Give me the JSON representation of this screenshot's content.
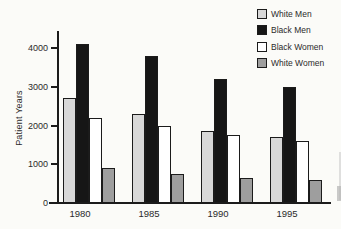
{
  "figure": {
    "background": "#fbfbf8",
    "axis_color": "#1b1b1b",
    "text_color": "#2a2a2a"
  },
  "chart_data": {
    "type": "bar",
    "title": "",
    "xlabel": "",
    "ylabel": "Patient Years",
    "categories": [
      "1980",
      "1985",
      "1990",
      "1995"
    ],
    "series": [
      {
        "name": "White Men",
        "color": "#d8d8d8",
        "values": [
          2700,
          2300,
          1850,
          1700
        ]
      },
      {
        "name": "Black Men",
        "color": "#161616",
        "values": [
          4100,
          3800,
          3200,
          3000
        ]
      },
      {
        "name": "Black Women",
        "color": "#ffffff",
        "values": [
          2200,
          2000,
          1750,
          1600
        ]
      },
      {
        "name": "White Women",
        "color": "#9e9e9e",
        "values": [
          900,
          750,
          650,
          600
        ]
      }
    ],
    "yticks": [
      0,
      1000,
      2000,
      3000,
      4000
    ],
    "ytick_labels": [
      "0",
      "1000",
      "2000",
      "3000",
      "4000"
    ],
    "ylim": [
      0,
      4450
    ],
    "grid": false,
    "legend_position": "top-right"
  }
}
